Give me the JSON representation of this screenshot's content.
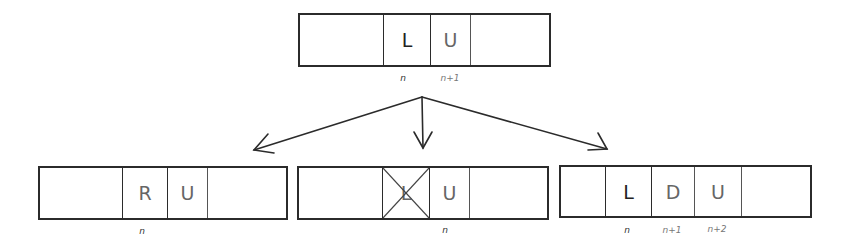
{
  "top_tape": {
    "cells": [
      "",
      "L",
      "U",
      ""
    ],
    "labels": [
      "n",
      "n+1"
    ]
  },
  "branches": [
    {
      "name": "left",
      "cells": [
        "",
        "R",
        "U",
        ""
      ],
      "labels": [
        "n"
      ]
    },
    {
      "name": "middle",
      "cells": [
        "",
        "L",
        "U",
        ""
      ],
      "crossed_cell": "L",
      "labels": [
        "n"
      ]
    },
    {
      "name": "right",
      "cells": [
        "",
        "L",
        "D",
        "U",
        ""
      ],
      "labels": [
        "n",
        "n+1",
        "n+2"
      ]
    }
  ],
  "colors": {
    "stroke": "#2b2b2b",
    "background": "#ffffff"
  }
}
